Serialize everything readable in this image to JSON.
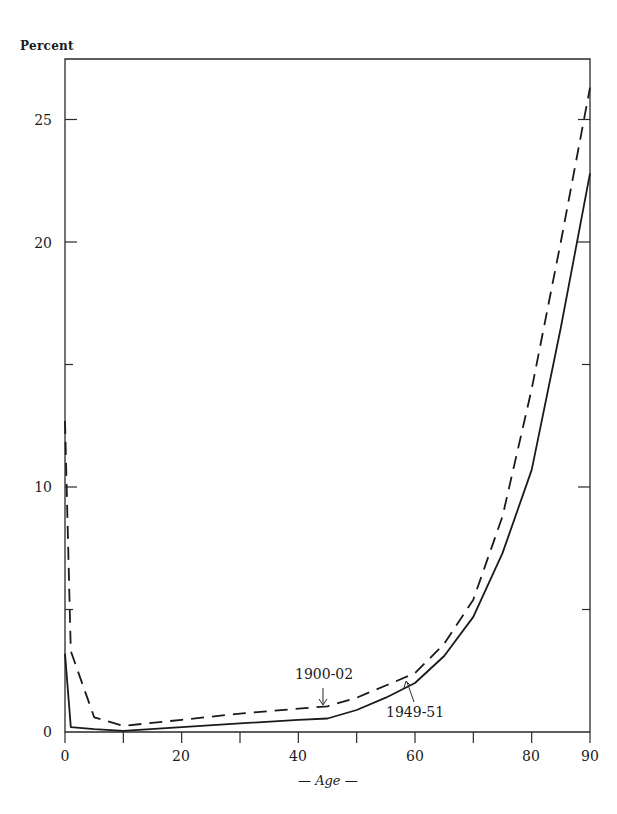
{
  "chart_data": {
    "type": "line",
    "title": "",
    "xlabel": "— Age —",
    "ylabel": "Percent",
    "xlim": [
      0,
      90
    ],
    "ylim": [
      0,
      27.5
    ],
    "grid": false,
    "legend": "none (inline annotations)",
    "x_ticks": [
      0,
      10,
      20,
      30,
      40,
      50,
      60,
      70,
      80,
      90
    ],
    "x_tick_labels": [
      "0",
      "20",
      "40",
      "60",
      "80",
      "90"
    ],
    "y_ticks": [
      0,
      5,
      10,
      15,
      20,
      25
    ],
    "y_tick_labels": [
      "0",
      "10",
      "20",
      "25"
    ],
    "series": [
      {
        "name": "1900-02",
        "style": "dashed",
        "x": [
          0,
          1,
          5,
          10,
          20,
          30,
          40,
          45,
          50,
          55,
          60,
          65,
          70,
          75,
          80,
          85,
          90
        ],
        "y": [
          12.7,
          3.3,
          0.6,
          0.25,
          0.5,
          0.75,
          0.95,
          1.05,
          1.4,
          1.9,
          2.4,
          3.6,
          5.4,
          8.8,
          14.0,
          20.0,
          26.3
        ]
      },
      {
        "name": "1949-51",
        "style": "solid",
        "x": [
          0,
          1,
          5,
          10,
          20,
          30,
          40,
          45,
          50,
          55,
          60,
          65,
          70,
          75,
          80,
          85,
          90
        ],
        "y": [
          3.2,
          0.2,
          0.12,
          0.05,
          0.2,
          0.35,
          0.5,
          0.55,
          0.9,
          1.4,
          2.0,
          3.1,
          4.7,
          7.3,
          10.7,
          16.5,
          22.8
        ]
      }
    ],
    "annotations": [
      {
        "text": "1900-02",
        "arrow_to": {
          "x": 44,
          "y": 1.05
        },
        "series": "1900-02"
      },
      {
        "text": "1949-51",
        "arrow_to": {
          "x": 59,
          "y": 2.0
        },
        "series": "1949-51"
      }
    ]
  },
  "labels": {
    "y_title": "Percent",
    "x_title": "— Age —",
    "ann_1900": "1900-02",
    "ann_1949": "1949-51",
    "y25": "25",
    "y20": "20",
    "y10": "10",
    "y0": "0",
    "x0": "0",
    "x20": "20",
    "x40": "40",
    "x60": "60",
    "x80": "80",
    "x90": "90"
  }
}
